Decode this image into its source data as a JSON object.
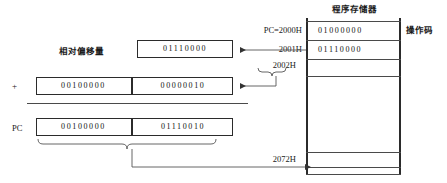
{
  "diagram": {
    "title_memory": "程序存储器",
    "label_opcode": "操作码",
    "label_offset": "相对偏移量",
    "label_plus": "+",
    "label_pc": "PC",
    "offset_value": "01110000",
    "addend_high": "00100000",
    "addend_low": "00000010",
    "result_high": "00100000",
    "result_low": "01110010",
    "addresses": {
      "pc_current": "PC=2000H",
      "addr_2001": "2001H",
      "addr_2002": "2002H",
      "addr_target": "2072H"
    },
    "memory_cells": [
      {
        "value": "01000000"
      },
      {
        "value": "01110000"
      },
      {
        "value": ""
      },
      {
        "value": ""
      },
      {
        "value": ""
      },
      {
        "value": ""
      }
    ],
    "colors": {
      "line": "#2b2b2b",
      "rule": "#4a4a4a",
      "text": "#111111",
      "background": "#ffffff"
    }
  }
}
